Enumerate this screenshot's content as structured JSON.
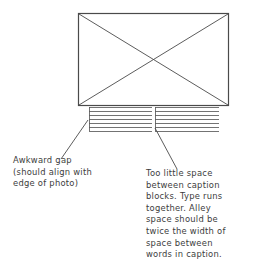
{
  "figure": {
    "background_color": "#ffffff",
    "ink_color": "#3c3c3c",
    "line_color": "#555555"
  },
  "photo_placeholder": {
    "name": "photo",
    "label": "photo placeholder with crossed diagonals",
    "x": 78,
    "y": 13,
    "width": 150,
    "height": 92,
    "border_color": "#4a4a4a",
    "border_width": 1.2,
    "diagonals": "x-cross"
  },
  "caption_blocks": [
    {
      "name": "caption-block-left",
      "label": "left caption block of ruled text lines",
      "x": 89,
      "y": 107,
      "width": 63,
      "height": 24,
      "line_count": 7,
      "rule_color": "#5a5a5a"
    },
    {
      "name": "caption-block-right",
      "label": "right caption block of ruled text lines",
      "x": 155,
      "y": 107,
      "width": 64,
      "height": 24,
      "line_count": 7,
      "rule_color": "#5a5a5a"
    }
  ],
  "leaders": [
    {
      "name": "leader-line-awkward-gap",
      "from_x": 88,
      "from_y": 120,
      "to_x": 61,
      "to_y": 159,
      "color": "#4a4a4a"
    },
    {
      "name": "leader-line-alley-space",
      "from_x": 155,
      "from_y": 128,
      "to_x": 177,
      "to_y": 169,
      "color": "#4a4a4a"
    }
  ],
  "annotations": {
    "left": {
      "id": "awkward-gap-note",
      "text": "Awkward gap\n(should align with\nedge of photo)"
    },
    "right": {
      "id": "alley-space-note",
      "text": "Too little space\nbetween caption\nblocks.  Type runs\ntogether.  Alley\nspace should be\ntwice the width of\nspace between\nwords in caption."
    }
  }
}
